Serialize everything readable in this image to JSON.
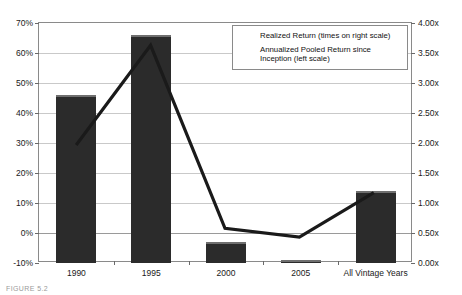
{
  "chart_data": {
    "type": "bar",
    "title": "",
    "subtitle": "",
    "xlabel": "",
    "ylabel": "",
    "categories": [
      "1990",
      "1995",
      "2000",
      "2005",
      "All Vintage Years"
    ],
    "grid": true,
    "legend_position": "top-right",
    "left_axis": {
      "label": "Annualized Pooled Return since Inception (left scale)",
      "min": -10,
      "max": 70,
      "step": 10,
      "tick_labels": [
        "-10%",
        "0%",
        "10%",
        "20%",
        "30%",
        "40%",
        "50%",
        "60%",
        "70%"
      ],
      "tick_values": [
        -10,
        0,
        10,
        20,
        30,
        40,
        50,
        60,
        70
      ]
    },
    "right_axis": {
      "label": "Realized Return (times on right scale)",
      "min": 0.0,
      "max": 4.0,
      "step": 0.5,
      "tick_labels": [
        "0.00x",
        "0.50x",
        "1.00x",
        "1.50x",
        "2.00x",
        "2.50x",
        "3.00x",
        "3.50x",
        "4.00x"
      ],
      "tick_values": [
        0.0,
        0.5,
        1.0,
        1.5,
        2.0,
        2.5,
        3.0,
        3.5,
        4.0
      ]
    },
    "series": [
      {
        "name": "Realized Return (times on right scale)",
        "type": "bar",
        "axis": "right",
        "color": "#2b2b2b",
        "values": [
          2.8,
          3.8,
          0.35,
          0.05,
          1.2
        ]
      },
      {
        "name": "Annualized Pooled Return since Inception (left scale)",
        "type": "line",
        "axis": "left",
        "color": "#1a1a1a",
        "values": [
          29.0,
          62.5,
          1.0,
          -2.0,
          13.0
        ]
      }
    ]
  },
  "legend": {
    "items": [
      {
        "label": "Realized Return (times on right scale)",
        "marker": "bar-swatch"
      },
      {
        "label": "Annualized Pooled Return since Inception (left scale)",
        "marker": "line-swatch"
      }
    ]
  },
  "caption": {
    "text": "FIGURE 5.2"
  }
}
